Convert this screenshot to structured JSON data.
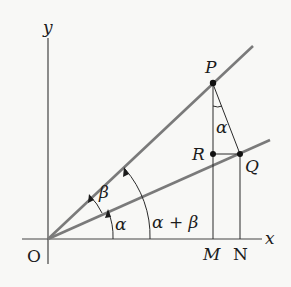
{
  "diagram": {
    "title": "",
    "axes": {
      "x_label": "x",
      "y_label": "y",
      "origin_label": "O"
    },
    "points": {
      "P": {
        "label": "P"
      },
      "Q": {
        "label": "Q"
      },
      "R": {
        "label": "R"
      },
      "M": {
        "label": "M"
      },
      "N": {
        "label": "N"
      }
    },
    "angles": {
      "alpha_lower": "α",
      "beta": "β",
      "alpha_plus_beta": "α + β",
      "alpha_at_P": "α"
    },
    "colors": {
      "ray": "#7a7a7a",
      "line": "#2a2a2a",
      "text": "#1c1c1c"
    }
  }
}
